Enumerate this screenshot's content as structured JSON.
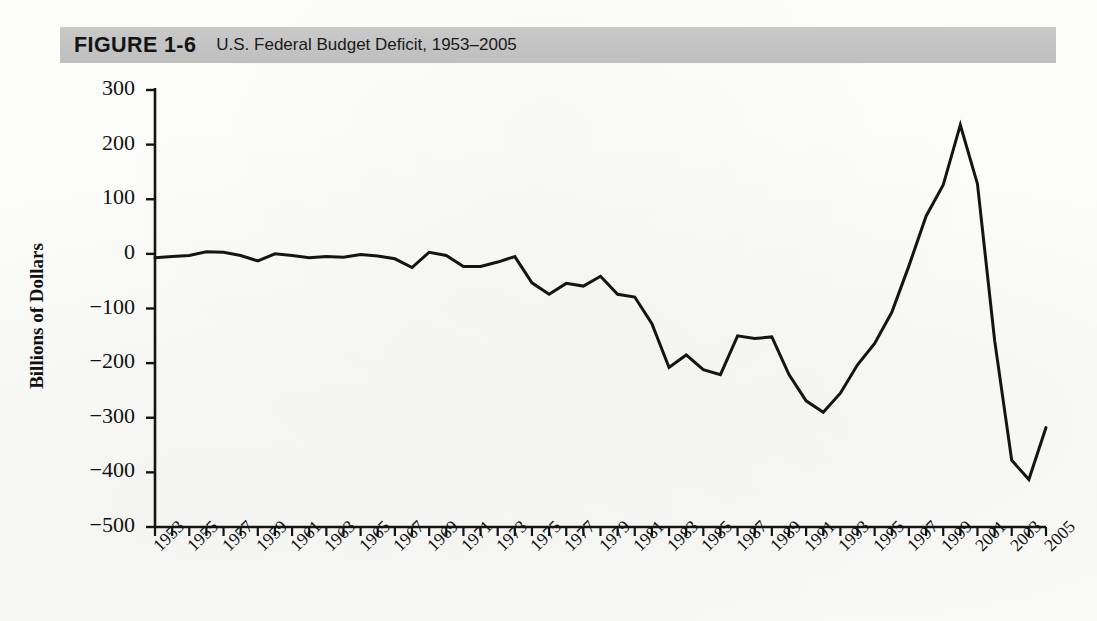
{
  "figure": {
    "number": "FIGURE 1-6",
    "caption": "U.S. Federal Budget Deficit, 1953–2005",
    "banner_color": "#c5c5c5"
  },
  "chart_data": {
    "type": "line",
    "title": "U.S. Federal Budget Deficit, 1953–2005",
    "xlabel": "",
    "ylabel": "Billions of Dollars",
    "ylim": [
      -500,
      300
    ],
    "yticks": [
      300,
      200,
      100,
      0,
      -100,
      -200,
      -300,
      -400,
      -500
    ],
    "ytick_labels": [
      "300",
      "200",
      "100",
      "0",
      "−100",
      "−200",
      "−300",
      "−400",
      "−500"
    ],
    "xlim": [
      1953,
      2005
    ],
    "xticks": [
      1953,
      1955,
      1957,
      1959,
      1961,
      1963,
      1965,
      1967,
      1969,
      1971,
      1973,
      1975,
      1977,
      1979,
      1981,
      1983,
      1985,
      1987,
      1989,
      1991,
      1993,
      1995,
      1997,
      1999,
      2001,
      2003,
      2005
    ],
    "xtick_labels": [
      "1953",
      "1955",
      "1957",
      "1959",
      "1961",
      "1963",
      "1965",
      "1967",
      "1969",
      "1971",
      "1973",
      "1975",
      "1977",
      "1979",
      "1981",
      "1983",
      "1985",
      "1987",
      "1989",
      "1991",
      "1993",
      "1995",
      "1997",
      "1999",
      "2001",
      "2003",
      "2005"
    ],
    "grid": false,
    "legend": null,
    "line_color": "#141414",
    "line_width": 3,
    "x": [
      1953,
      1954,
      1955,
      1956,
      1957,
      1958,
      1959,
      1960,
      1961,
      1962,
      1963,
      1964,
      1965,
      1966,
      1967,
      1968,
      1969,
      1970,
      1971,
      1972,
      1973,
      1974,
      1975,
      1976,
      1977,
      1978,
      1979,
      1980,
      1981,
      1982,
      1983,
      1984,
      1985,
      1986,
      1987,
      1988,
      1989,
      1990,
      1991,
      1992,
      1993,
      1994,
      1995,
      1996,
      1997,
      1998,
      1999,
      2000,
      2001,
      2002,
      2003,
      2004,
      2005
    ],
    "values": [
      -7,
      -5,
      -3,
      4,
      3,
      -3,
      -13,
      0,
      -3,
      -7,
      -5,
      -6,
      -1,
      -4,
      -9,
      -25,
      3,
      -3,
      -23,
      -23,
      -15,
      -5,
      -53,
      -74,
      -54,
      -59,
      -41,
      -74,
      -79,
      -128,
      -208,
      -185,
      -212,
      -221,
      -150,
      -155,
      -152,
      -221,
      -269,
      -290,
      -255,
      -203,
      -164,
      -107,
      -22,
      69,
      126,
      236,
      128,
      -158,
      -378,
      -413,
      -318
    ]
  },
  "annotations": {
    "peak_year": "2001",
    "peak_value": "236",
    "deepest_year": "2004",
    "deepest_value": "-413"
  }
}
